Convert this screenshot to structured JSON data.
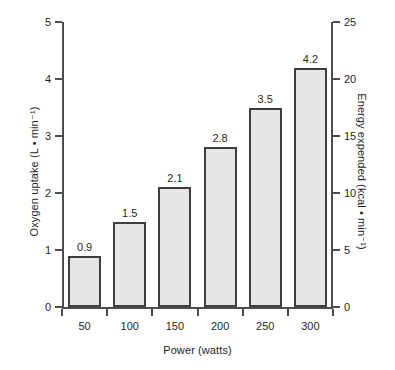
{
  "chart_data": {
    "type": "bar",
    "title": "",
    "xlabel": "Power (watts)",
    "ylabel": "Oxygen uptake (L • min⁻¹)",
    "ylabel_right": "Energy expended (kcal • min⁻¹)",
    "categories": [
      "50",
      "100",
      "150",
      "200",
      "250",
      "300"
    ],
    "values": [
      0.9,
      1.5,
      2.1,
      2.8,
      3.5,
      4.2
    ],
    "value_labels": [
      "0.9",
      "1.5",
      "2.1",
      "2.8",
      "3.5",
      "4.2"
    ],
    "ylim": [
      0,
      5
    ],
    "yticks": [
      0,
      1,
      2,
      3,
      4,
      5
    ],
    "ytick_labels": [
      "0",
      "1",
      "2",
      "3",
      "4",
      "5"
    ],
    "ylim_right": [
      0,
      25
    ],
    "yticks_right": [
      0,
      5,
      10,
      15,
      20,
      25
    ],
    "ytick_labels_right": [
      "0",
      "5",
      "10",
      "15",
      "20",
      "25"
    ],
    "xtick_labels": [
      "50",
      "100",
      "150",
      "200",
      "250",
      "300"
    ],
    "grid": false,
    "legend": false,
    "bar_fill_color": "#e6e6e6",
    "bar_edge_color": "#3d3d3d",
    "axis_color": "#4d4d4d",
    "background_color": "#ffffff"
  }
}
